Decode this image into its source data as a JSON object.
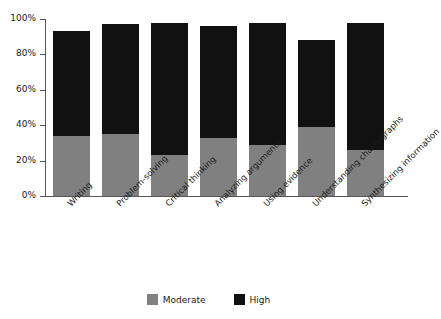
{
  "chart_data": {
    "type": "bar",
    "stacked": true,
    "title": "",
    "subtitle": "",
    "xlabel": "",
    "ylabel": "",
    "ylim": [
      0,
      100
    ],
    "yticks": [
      "0%",
      "20%",
      "40%",
      "60%",
      "80%",
      "100%"
    ],
    "ytick_values": [
      0,
      20,
      40,
      60,
      80,
      100
    ],
    "grid": false,
    "legend_position": "bottom",
    "categories": [
      "Writing",
      "Problem-solving",
      "Critical thinking",
      "Analyzing arguments",
      "Using evidence",
      "Understanding charts/graphs",
      "Synthesizing information"
    ],
    "series": [
      {
        "name": "Moderate",
        "color": "#808080",
        "values": [
          34,
          35,
          23,
          33,
          29,
          39,
          26
        ]
      },
      {
        "name": "High",
        "color": "#111111",
        "values": [
          59,
          62,
          75,
          63,
          69,
          49,
          72
        ]
      }
    ],
    "totals": [
      93,
      97,
      98,
      96,
      98,
      88,
      98
    ]
  },
  "legend": {
    "items": [
      {
        "label": "Moderate",
        "color": "#808080"
      },
      {
        "label": "High",
        "color": "#111111"
      }
    ]
  }
}
